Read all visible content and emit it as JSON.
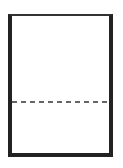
{
  "diagram": {
    "shape": "page-with-dashed-split",
    "frame": {
      "border_color": "#222222",
      "fill_color": "#ffffff"
    },
    "divider": {
      "style": "dashed",
      "color": "#333333",
      "position_ratio": 0.64
    }
  }
}
